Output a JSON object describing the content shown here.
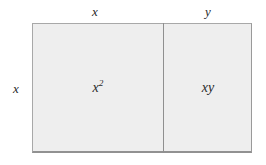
{
  "diagram": {
    "type": "area-model-rectangle",
    "title": "",
    "canvas": {
      "width": 266,
      "height": 165,
      "background_color": "#ffffff"
    },
    "rectangle": {
      "fill_color": "#eeeeee",
      "border_color": "#9a9a9a",
      "divider_color": "#8f8f8f"
    },
    "dimension_labels": {
      "top_left": "x",
      "top_right": "y",
      "left": "x"
    },
    "cells": [
      {
        "name": "left-cell",
        "label": "x",
        "exponent": "2",
        "expression": "x²"
      },
      {
        "name": "right-cell",
        "label": "xy",
        "expression": "xy"
      }
    ]
  }
}
